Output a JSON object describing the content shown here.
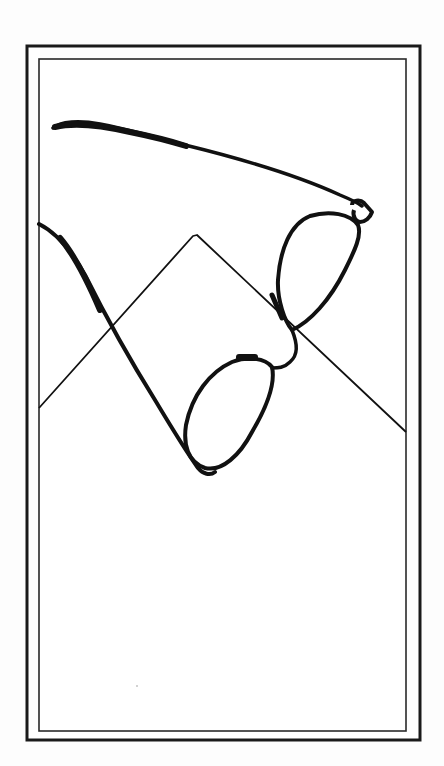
{
  "artwork": {
    "subject": "eyeglasses resting on an envelope",
    "style": "black ink line drawing with double rectangular border",
    "colors": {
      "background": "#fdfdfd",
      "paper": "#ffffff",
      "ink": "#111111",
      "frame": "#1a1a1a"
    },
    "elements": [
      "outer-frame",
      "inner-frame",
      "envelope-flap",
      "glasses-temple-arm",
      "glasses-upper-lens",
      "glasses-lower-lens",
      "glasses-bridge",
      "glasses-lower-arm"
    ]
  }
}
